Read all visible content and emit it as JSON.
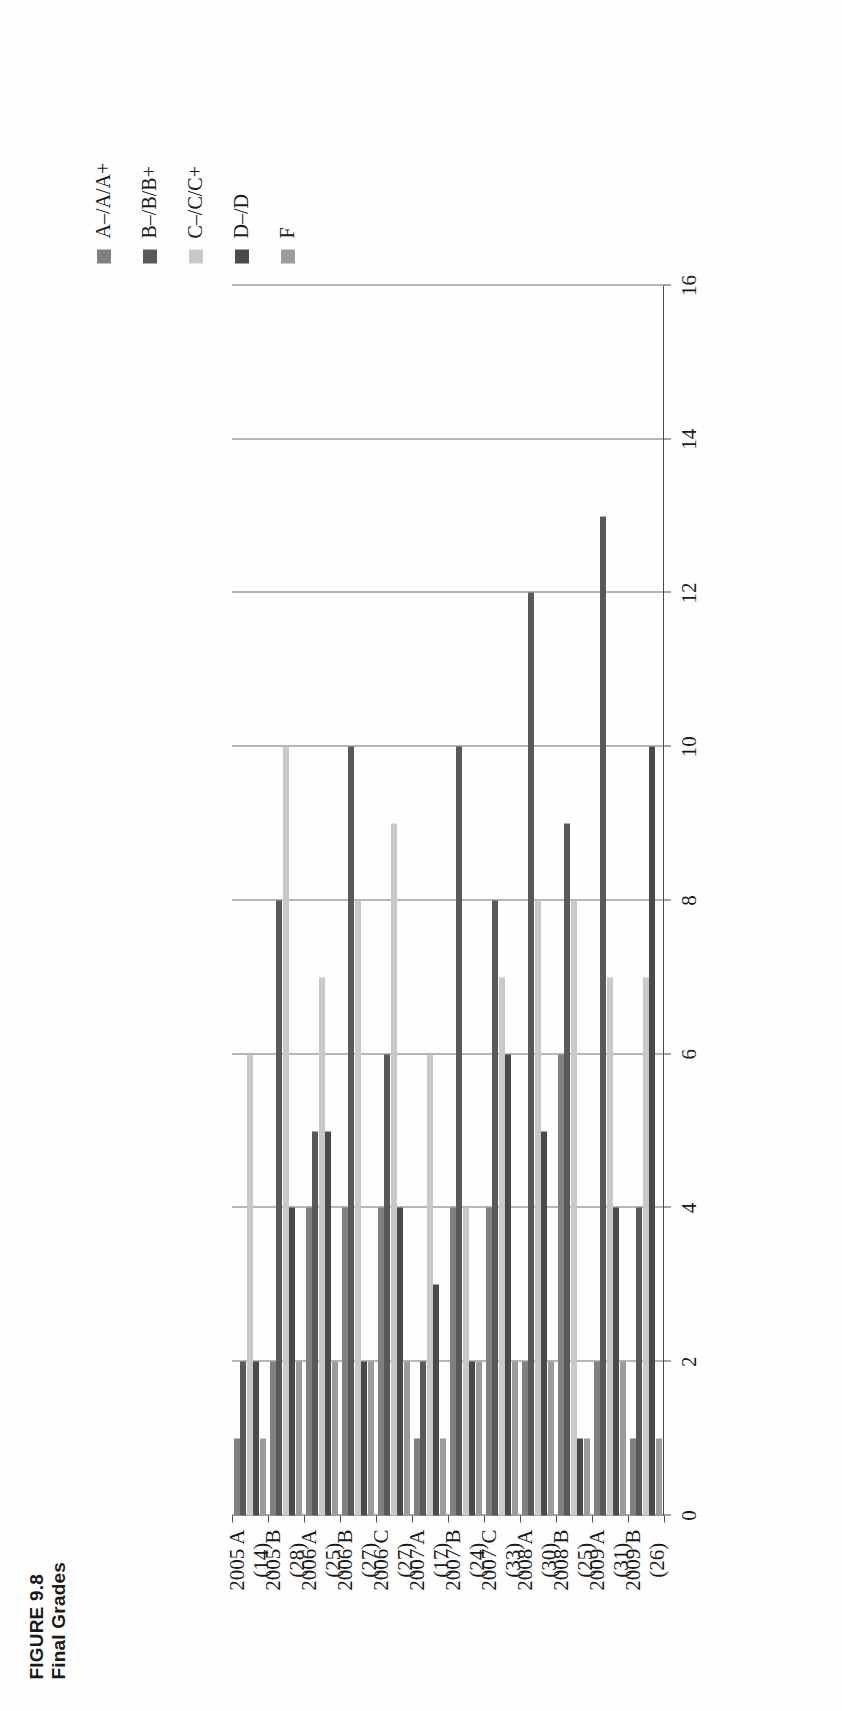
{
  "title": {
    "line1": "FIGURE 9.8",
    "line2": "Final Grades"
  },
  "legend": {
    "position": "right",
    "items": [
      {
        "label": "A–/A/A+",
        "color": "#808080"
      },
      {
        "label": "B–/B/B+",
        "color": "#595959"
      },
      {
        "label": "C–/C/C+",
        "color": "#c8c8c8"
      },
      {
        "label": "D–/D",
        "color": "#4a4a4a"
      },
      {
        "label": "F",
        "color": "#9c9c9c"
      }
    ]
  },
  "axis": {
    "tick_labels": [
      "16",
      "14",
      "12",
      "10",
      "8",
      "6",
      "4",
      "2",
      "0"
    ],
    "min": 0,
    "max": 16,
    "step": 2,
    "grid": true
  },
  "categories": [
    {
      "term": "2005 A",
      "n": "(14)"
    },
    {
      "term": "2005 B",
      "n": "(28)"
    },
    {
      "term": "2006 A",
      "n": "(25)"
    },
    {
      "term": "2006 B",
      "n": "(27)"
    },
    {
      "term": "2006 C",
      "n": "(27)"
    },
    {
      "term": "2007 A",
      "n": "(17)"
    },
    {
      "term": "2007 B",
      "n": "(24)"
    },
    {
      "term": "2007 C",
      "n": "(33)"
    },
    {
      "term": "2008 A",
      "n": "(30)"
    },
    {
      "term": "2008 B",
      "n": "(25)"
    },
    {
      "term": "2009 A",
      "n": "(31)"
    },
    {
      "term": "2009 B",
      "n": "(26)"
    }
  ],
  "chart_data": {
    "type": "bar",
    "orientation": "horizontal",
    "title": "FIGURE 9.8 Final Grades",
    "xlabel": "",
    "ylabel": "",
    "ylim": [
      0,
      16
    ],
    "grid": true,
    "legend_position": "right",
    "categories": [
      "2005 A (14)",
      "2005 B (28)",
      "2006 A (25)",
      "2006 B (27)",
      "2006 C (27)",
      "2007 A (17)",
      "2007 B (24)",
      "2007 C (33)",
      "2008 A (30)",
      "2008 B (25)",
      "2009 A (31)",
      "2009 B (26)"
    ],
    "series": [
      {
        "name": "A–/A/A+",
        "color": "#808080",
        "values": [
          1,
          2,
          4,
          4,
          4,
          1,
          4,
          4,
          2,
          6,
          2,
          1
        ]
      },
      {
        "name": "B–/B/B+",
        "color": "#595959",
        "values": [
          2,
          8,
          5,
          10,
          6,
          2,
          10,
          8,
          12,
          9,
          13,
          4
        ]
      },
      {
        "name": "C–/C/C+",
        "color": "#c8c8c8",
        "values": [
          6,
          10,
          7,
          8,
          9,
          6,
          4,
          7,
          8,
          8,
          7,
          7
        ]
      },
      {
        "name": "D–/D",
        "color": "#4a4a4a",
        "values": [
          2,
          4,
          5,
          2,
          4,
          3,
          2,
          6,
          5,
          1,
          4,
          10
        ]
      },
      {
        "name": "F",
        "color": "#9c9c9c",
        "values": [
          1,
          2,
          2,
          2,
          2,
          1,
          2,
          2,
          2,
          1,
          2,
          1
        ]
      }
    ]
  }
}
